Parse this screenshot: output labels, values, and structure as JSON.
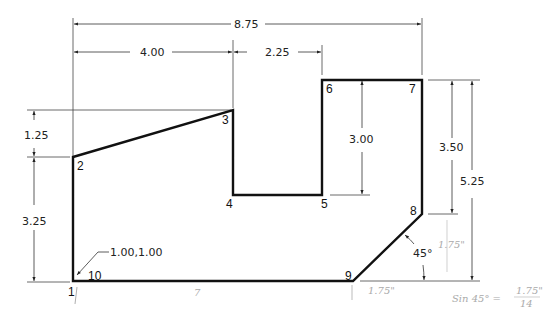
{
  "drawing": {
    "title": "Dimensioned polygon with numbered vertices",
    "colors": {
      "outline": "#111111",
      "dimension": "#333333",
      "annotation": "#aaaaaa",
      "background": "#ffffff"
    },
    "dimensions": {
      "overall_width": "8.75",
      "left_width": "4.00",
      "notch_offset": "2.25",
      "left_upper_height": "1.25",
      "left_lower_height": "3.25",
      "notch_depth": "3.00",
      "right_upper_height": "3.50",
      "overall_height": "5.25",
      "chamfer_angle": "45°",
      "origin_coordinate": "1.00,1.00"
    },
    "vertices": [
      {
        "id": "1",
        "label": "1"
      },
      {
        "id": "2",
        "label": "2"
      },
      {
        "id": "3",
        "label": "3"
      },
      {
        "id": "4",
        "label": "4"
      },
      {
        "id": "5",
        "label": "5"
      },
      {
        "id": "6",
        "label": "6"
      },
      {
        "id": "7",
        "label": "7"
      },
      {
        "id": "8",
        "label": "8"
      },
      {
        "id": "9",
        "label": "9"
      },
      {
        "id": "10",
        "label": "10"
      }
    ],
    "handwritten_notes": {
      "bottom_length": "7",
      "chamfer_horizontal": "1.75\"",
      "chamfer_vertical": "1.75\"",
      "formula_left": "Sin 45° =",
      "formula_numerator": "1.75\"",
      "formula_denominator": "14"
    }
  }
}
